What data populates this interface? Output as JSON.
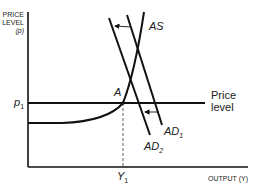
{
  "diagram": {
    "yaxis": {
      "line1": "PRICE",
      "line2": "LEVEL",
      "line3": "(p)"
    },
    "xaxis": {
      "label": "OUTPUT (Y)"
    },
    "curves": {
      "as": "AS",
      "ad1": "AD",
      "ad1_sub": "1",
      "ad2": "AD",
      "ad2_sub": "2"
    },
    "price_level": {
      "line1": "Price",
      "line2": "level"
    },
    "points": {
      "a": "A",
      "p1": "p",
      "p1_sub": "1",
      "y1": "Y",
      "y1_sub": "1"
    },
    "colors": {
      "line": "#111111",
      "text": "#222222"
    }
  }
}
